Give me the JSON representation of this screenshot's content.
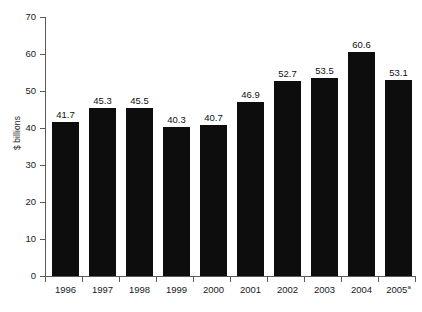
{
  "chart_data": {
    "type": "bar",
    "title": "",
    "subtitle": "",
    "xlabel": "",
    "ylabel": "$ billions",
    "categories": [
      "1996",
      "1997",
      "1998",
      "1999",
      "2000",
      "2001",
      "2002",
      "2003",
      "2004",
      "2005"
    ],
    "category_labels": [
      "1996",
      "1997",
      "1998",
      "1999",
      "2000",
      "2001",
      "2002",
      "2003",
      "2004",
      "2005"
    ],
    "category_footnotes": [
      "",
      "",
      "",
      "",
      "",
      "",
      "",
      "",
      "",
      "a"
    ],
    "values": [
      41.7,
      45.3,
      45.5,
      40.3,
      40.7,
      46.9,
      52.7,
      53.5,
      60.6,
      53.1
    ],
    "value_labels": [
      "41.7",
      "45.3",
      "45.5",
      "40.3",
      "40.7",
      "46.9",
      "52.7",
      "53.5",
      "60.6",
      "53.1"
    ],
    "ylim": [
      0,
      70
    ],
    "yticks": [
      0,
      10,
      20,
      30,
      40,
      50,
      60,
      70
    ],
    "ytick_labels": [
      "0",
      "10",
      "20",
      "30",
      "40",
      "50",
      "60",
      "70"
    ],
    "grid": false,
    "legend": false,
    "legend_position": "none",
    "bar_color": "#0d0d0d",
    "axis_color": "#5a5a5a",
    "background_color": "#ffffff",
    "data_labels_shown": true
  }
}
